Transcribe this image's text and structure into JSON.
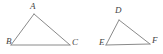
{
  "figure": {
    "background_color": "#ffffff",
    "stroke_color": "#8a8a8a",
    "label_color": "#444444",
    "stroke_width": 1,
    "width": 163,
    "height": 54,
    "triangles": [
      {
        "id": "triangle-abc",
        "name": "Triangle ABC",
        "vertices": [
          {
            "label": "A",
            "x": 34,
            "y": 14,
            "label_x": 30,
            "label_y": 2
          },
          {
            "label": "B",
            "x": 11,
            "y": 45,
            "label_x": 6,
            "label_y": 37
          },
          {
            "label": "C",
            "x": 70,
            "y": 45,
            "label_x": 72,
            "label_y": 38
          }
        ],
        "edges": [
          {
            "name": "side-AB",
            "from": "A",
            "to": "B"
          },
          {
            "name": "side-AC",
            "from": "A",
            "to": "C"
          },
          {
            "name": "side-BC",
            "from": "B",
            "to": "C"
          }
        ]
      },
      {
        "id": "triangle-def",
        "name": "Triangle DEF",
        "vertices": [
          {
            "label": "D",
            "x": 119,
            "y": 20,
            "label_x": 115,
            "label_y": 6
          },
          {
            "label": "E",
            "x": 106,
            "y": 45,
            "label_x": 99,
            "label_y": 38
          },
          {
            "label": "F",
            "x": 150,
            "y": 44,
            "label_x": 152,
            "label_y": 36
          }
        ],
        "edges": [
          {
            "name": "side-DE",
            "from": "D",
            "to": "E"
          },
          {
            "name": "side-DF",
            "from": "D",
            "to": "F"
          },
          {
            "name": "side-EF",
            "from": "E",
            "to": "F"
          }
        ]
      }
    ],
    "labels": {
      "a": "A",
      "b": "B",
      "c": "C",
      "d": "D",
      "e": "E",
      "f": "F"
    }
  }
}
